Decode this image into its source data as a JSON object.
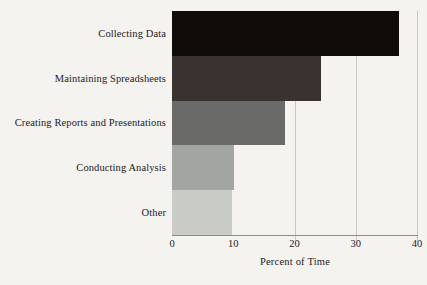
{
  "chart_data": {
    "type": "bar",
    "orientation": "horizontal",
    "title": "",
    "xlabel": "Percent of Time",
    "ylabel": "",
    "categories": [
      "Collecting Data",
      "Maintaining Spreadsheets",
      "Creating Reports and Presentations",
      "Conducting Analysis",
      "Other"
    ],
    "values": [
      37,
      24.3,
      18.5,
      10.2,
      9.8
    ],
    "xlim": [
      0,
      40
    ],
    "xticks": [
      0,
      10,
      20,
      30,
      40
    ],
    "xtick_labels": [
      "0",
      "10",
      "20",
      "30",
      "40"
    ],
    "gridlines_at": [
      20,
      30,
      40
    ],
    "grid": true,
    "legend": "none",
    "bar_colors": [
      "#100c0a",
      "#3a322f",
      "#6a6a68",
      "#a3a5a3",
      "#c9cbc7"
    ],
    "grid_color": "#c9c8c4",
    "axis_color": "#8e8d89",
    "background_color": "#f4f3ef",
    "text_color": "#23211f"
  }
}
